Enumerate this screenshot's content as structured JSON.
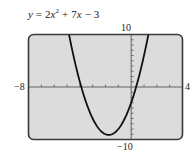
{
  "chart_data": {
    "type": "line",
    "function": "2x^2 + 7x - 3",
    "coefficients": {
      "a": 2,
      "b": 7,
      "c": -3
    },
    "xlabel": "",
    "ylabel": "",
    "xlim": [
      -8,
      4
    ],
    "ylim": [
      -10,
      10
    ],
    "xscale": 1,
    "yscale": 1,
    "grid": false,
    "legend": null,
    "vertex": {
      "x": -1.75,
      "y": -9.125
    },
    "x_intercepts": [
      -3.886,
      0.386
    ],
    "y_intercept": -3,
    "series": [
      {
        "name": "y = 2x^2 + 7x - 3",
        "x": [
          -4.84,
          -4.5,
          -4,
          -3.5,
          -3,
          -2.5,
          -2,
          -1.75,
          -1.5,
          -1,
          -0.5,
          0,
          0.5,
          1,
          1.34
        ],
        "y": [
          10.0,
          6.0,
          1.0,
          -2.0,
          -6.0,
          -8.0,
          -9.0,
          -9.125,
          -9.0,
          -8.0,
          -5.0,
          -3.0,
          1.0,
          6.0,
          10.0
        ]
      }
    ],
    "window_labels": {
      "xmin": "−8",
      "xmax": "4",
      "ymax": "10",
      "ymin": "−10"
    }
  },
  "title": {
    "prefix": "y",
    "eq": " = 2",
    "x1": "x",
    "exp": "2",
    "plus": " + 7",
    "x2": "x",
    "rest": " − 3"
  },
  "labels": {
    "xmin": "−8",
    "xmax": "4",
    "ymax": "10",
    "ymin": "−10"
  },
  "colors": {
    "screen_bg": "#dcdcdc",
    "frame": "#3a3a3a",
    "curve": "#111111",
    "axis": "#555555"
  }
}
